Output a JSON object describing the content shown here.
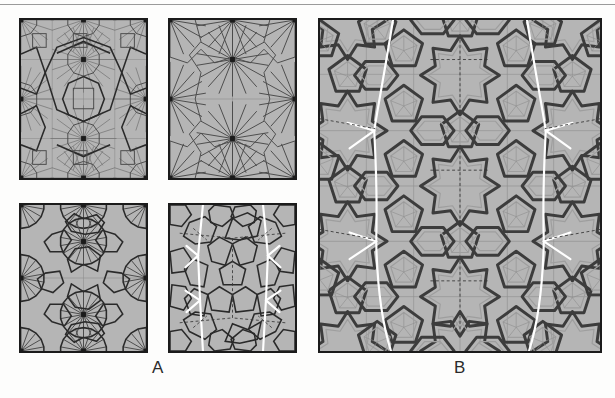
{
  "figure": {
    "width": 615,
    "height": 398,
    "background_color": "#fdfdfc",
    "top_rule_color": "#9a9a9a"
  },
  "labels": {
    "group_a": "A",
    "group_b": "B"
  },
  "colors": {
    "panel_fill": "#b5b5b5",
    "panel_border": "#1b1b1b",
    "thin_line": "#6e6e6e",
    "medium_line": "#4a4a4a",
    "dark_line": "#2a2a2a",
    "white_line": "#ffffff",
    "dashed_line": "#3a3a3a",
    "band_outer": "#3c3c3c",
    "band_inner": "#9e9e9e",
    "vertex_marker": "#1b1b1b"
  },
  "panels": [
    {
      "id": "a1",
      "group": "A",
      "position": "top-left",
      "description": "radial star-burst tiling with square and decagonal cells, dark outlined decagon outline overlay",
      "bounds": {
        "x": 19,
        "y": 18,
        "width": 129,
        "height": 162
      },
      "vertex_count": 9,
      "features": [
        "radial-spokes",
        "decagon-outline",
        "square-cells",
        "vertex-dots"
      ]
    },
    {
      "id": "a2",
      "group": "A",
      "position": "top-right",
      "description": "sparser radial star-burst tiling, fewer subdivision lines, six-fold hub points",
      "bounds": {
        "x": 168,
        "y": 18,
        "width": 129,
        "height": 162
      },
      "vertex_count": 9,
      "features": [
        "radial-spokes",
        "hexagonal-envelopes",
        "vertex-dots"
      ]
    },
    {
      "id": "a3",
      "group": "A",
      "position": "bottom-left",
      "description": "dense radial fan tiling with circular hubs and polygonal cell boundaries",
      "bounds": {
        "x": 19,
        "y": 203,
        "width": 129,
        "height": 150
      },
      "vertex_count": 9,
      "features": [
        "radial-fans",
        "circular-hubs",
        "polygon-cells",
        "vertex-dots"
      ]
    },
    {
      "id": "a4",
      "group": "A",
      "position": "bottom-right",
      "description": "pentagonal / Penrose-like tiling with white Y-junction lines and dashed symmetry axes",
      "bounds": {
        "x": 168,
        "y": 203,
        "width": 129,
        "height": 150
      },
      "features": [
        "pentagon-tiles",
        "white-y-junctions",
        "dashed-axes"
      ]
    },
    {
      "id": "b",
      "group": "B",
      "position": "right",
      "description": "large girih-style interlaced strapwork pattern with ten-fold stars, pentagons, and white defect lines",
      "bounds": {
        "x": 318,
        "y": 18,
        "width": 284,
        "height": 335
      },
      "features": [
        "interlaced-bands",
        "ten-fold-stars",
        "pentagon-rosettes",
        "white-defect-lines",
        "dashed-axes"
      ]
    }
  ]
}
